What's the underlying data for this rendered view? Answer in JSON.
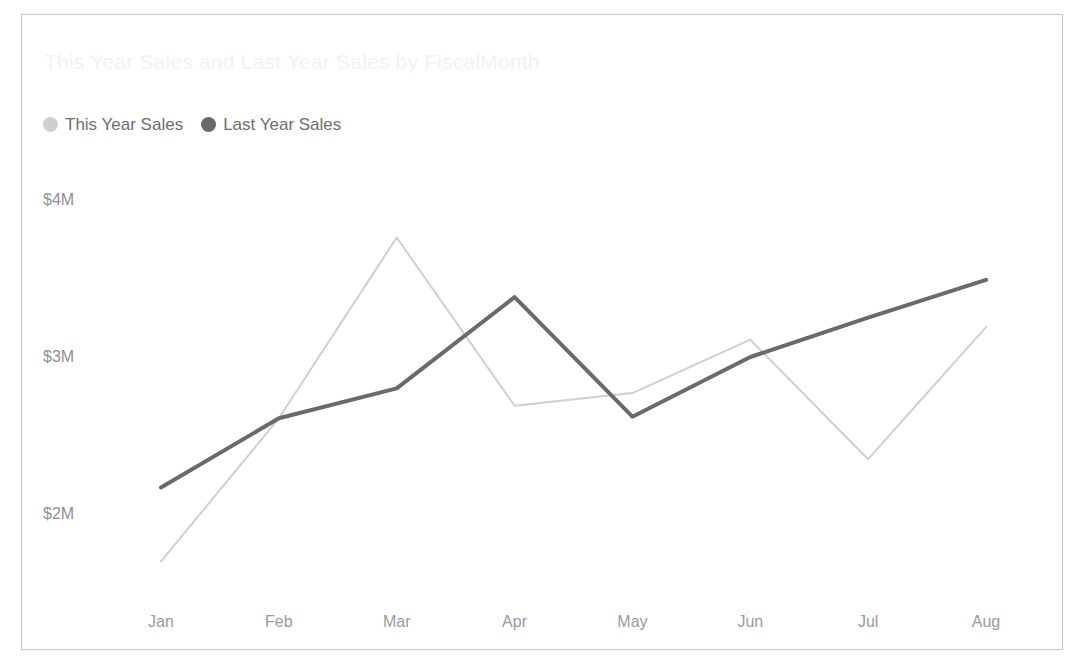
{
  "chart_title": "This Year Sales and Last Year Sales by FiscalMonth",
  "legend": {
    "position": "top-left",
    "items": [
      {
        "label": "This Year Sales",
        "color": "#cfcfcf",
        "marker": "circle-icon"
      },
      {
        "label": "Last Year Sales",
        "color": "#6a6a6a",
        "marker": "circle-icon"
      }
    ]
  },
  "axes": {
    "y_ticks": [
      "$2M",
      "$3M",
      "$4M"
    ],
    "y_tick_values": [
      2000000,
      3000000,
      4000000
    ],
    "x_ticks": [
      "Jan",
      "Feb",
      "Mar",
      "Apr",
      "May",
      "Jun",
      "Jul",
      "Aug"
    ]
  },
  "chart_data": {
    "type": "line",
    "title": "This Year Sales and Last Year Sales by FiscalMonth",
    "xlabel": "FiscalMonth",
    "ylabel": "",
    "categories": [
      "Jan",
      "Feb",
      "Mar",
      "Apr",
      "May",
      "Jun",
      "Jul",
      "Aug"
    ],
    "ylim": [
      1550000,
      4100000
    ],
    "ytick_labels": [
      "$2M",
      "$3M",
      "$4M"
    ],
    "ytick_values": [
      2000000,
      3000000,
      4000000
    ],
    "grid": false,
    "legend_position": "top-left",
    "series": [
      {
        "name": "This Year Sales",
        "color": "#cfcfcf",
        "line_width": 2,
        "values": [
          1700000,
          2610000,
          3760000,
          2690000,
          2770000,
          3110000,
          2350000,
          3190000
        ]
      },
      {
        "name": "Last Year Sales",
        "color": "#6a6a6a",
        "line_width": 4,
        "values": [
          2170000,
          2610000,
          2800000,
          3380000,
          2620000,
          3000000,
          3250000,
          3490000
        ]
      }
    ]
  }
}
